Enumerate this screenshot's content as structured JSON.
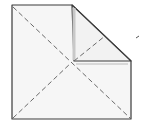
{
  "diagram": {
    "type": "origami-fold",
    "colors": {
      "paper": "#f6f6f6",
      "outline": "#3a3a3a",
      "crease": "#6a6a6a",
      "shadow": "#c8c8c8"
    },
    "labels": []
  }
}
